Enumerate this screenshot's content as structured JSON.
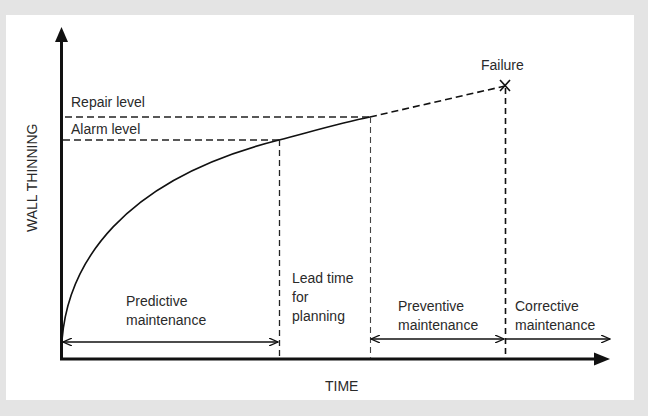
{
  "diagram": {
    "axes": {
      "y_label": "WALL THINNING",
      "x_label": "TIME"
    },
    "levels": {
      "repair": "Repair level",
      "alarm": "Alarm level"
    },
    "failure_label": "Failure",
    "intervals": {
      "predictive": [
        "Predictive",
        "maintenance"
      ],
      "lead_time": [
        "Lead time",
        "for",
        "planning"
      ],
      "preventive": [
        "Preventive",
        "maintenance"
      ],
      "corrective": [
        "Corrective",
        "maintenance"
      ]
    },
    "colors": {
      "background": "#e4e4e4",
      "panel": "#ffffff",
      "ink": "#1a1a1a",
      "text": "#2a2a2a"
    }
  }
}
